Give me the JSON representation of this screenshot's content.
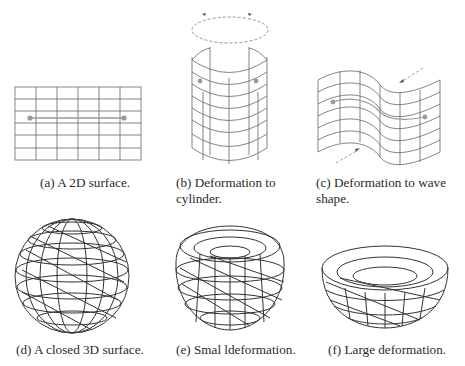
{
  "figure": {
    "panels": [
      {
        "id": "a",
        "caption": "(a) A 2D surface.",
        "shape": "flat-grid"
      },
      {
        "id": "b",
        "caption_line1": "(b) Deformation to",
        "caption_line2": "cylinder.",
        "shape": "cylinder"
      },
      {
        "id": "c",
        "caption_line1": "(c) Deformation to wave",
        "caption_line2": "shape.",
        "shape": "wave-surface"
      },
      {
        "id": "d",
        "caption": "(d) A closed 3D surface.",
        "shape": "sphere-mesh"
      },
      {
        "id": "e",
        "caption": "(e) Smal ldeformation.",
        "shape": "dented-sphere-mesh"
      },
      {
        "id": "f",
        "caption": "(f) Large deformation.",
        "shape": "bowl-mesh"
      }
    ],
    "colors": {
      "line": "#555555",
      "mesh": "#333333",
      "marker": "#9a9a9a",
      "dash": "#888888"
    }
  }
}
